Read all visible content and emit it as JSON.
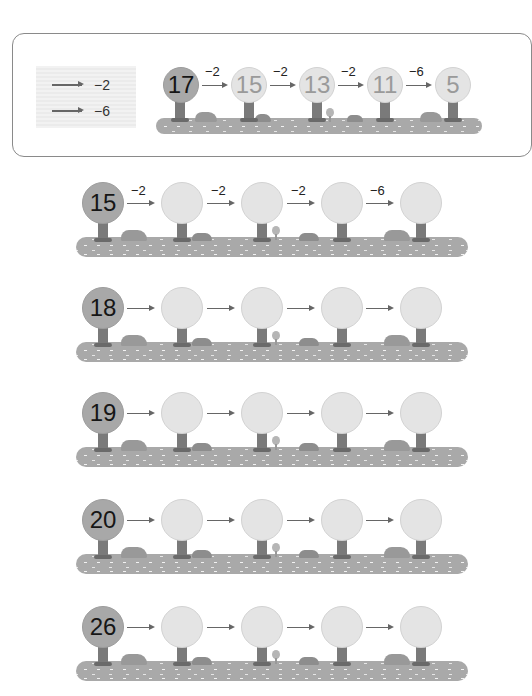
{
  "legend": [
    {
      "label": "−2"
    },
    {
      "label": "−6"
    }
  ],
  "example": {
    "start": "17",
    "steps": [
      {
        "op": "−2",
        "result": "15"
      },
      {
        "op": "−2",
        "result": "13"
      },
      {
        "op": "−2",
        "result": "11"
      },
      {
        "op": "−6",
        "result": "5"
      }
    ]
  },
  "exercises": [
    {
      "start": "15",
      "ops": [
        "−2",
        "−2",
        "−2",
        "−6"
      ],
      "answers": [
        "",
        "",
        "",
        ""
      ]
    },
    {
      "start": "18",
      "ops": [
        "",
        "",
        "",
        ""
      ],
      "answers": [
        "",
        "",
        "",
        ""
      ]
    },
    {
      "start": "19",
      "ops": [
        "",
        "",
        "",
        ""
      ],
      "answers": [
        "",
        "",
        "",
        ""
      ]
    },
    {
      "start": "20",
      "ops": [
        "",
        "",
        "",
        ""
      ],
      "answers": [
        "",
        "",
        "",
        ""
      ]
    },
    {
      "start": "26",
      "ops": [
        "",
        "",
        "",
        ""
      ],
      "answers": [
        "",
        "",
        "",
        ""
      ]
    }
  ],
  "colors": {
    "start_crown": "#a8a8a8",
    "blank_crown": "#e4e4e4",
    "ground": "#a9a9a9",
    "trunk": "#7a7a7a",
    "arrow": "#666666"
  }
}
